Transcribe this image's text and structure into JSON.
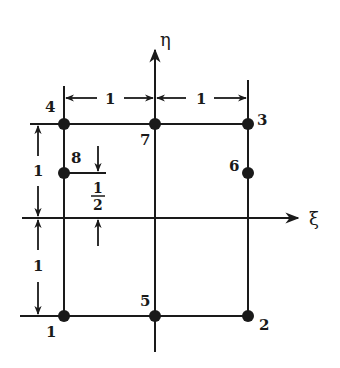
{
  "diagram": {
    "type": "eight-node serendipity quadrilateral element in natural coordinates",
    "axes": {
      "horizontal": "ξ",
      "vertical": "η"
    },
    "nodes": [
      {
        "id": "1",
        "label": "1",
        "xi": -1,
        "eta": -1
      },
      {
        "id": "2",
        "label": "2",
        "xi": 1,
        "eta": -1
      },
      {
        "id": "3",
        "label": "3",
        "xi": 1,
        "eta": 1
      },
      {
        "id": "4",
        "label": "4",
        "xi": -1,
        "eta": 1
      },
      {
        "id": "5",
        "label": "5",
        "xi": 0,
        "eta": -1
      },
      {
        "id": "6",
        "label": "6",
        "xi": 1,
        "eta": 0.5
      },
      {
        "id": "7",
        "label": "7",
        "xi": 0,
        "eta": 1
      },
      {
        "id": "8",
        "label": "8",
        "xi": -1,
        "eta": 0.5
      }
    ],
    "dimensions": {
      "top_left": "1",
      "top_right": "1",
      "left_upper": "1",
      "left_lower": "1",
      "node8_offset_num": "1",
      "node8_offset_den": "2"
    },
    "colors": {
      "ink": "#1a1a1a",
      "background": "#ffffff"
    }
  }
}
